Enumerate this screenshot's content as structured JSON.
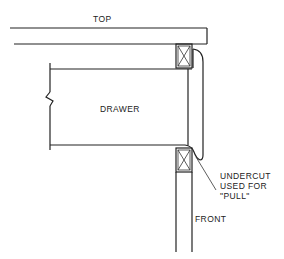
{
  "diagram": {
    "labels": {
      "top": "TOP",
      "drawer": "DRAWER",
      "undercut_line1": "UNDERCUT",
      "undercut_line2": "USED FOR",
      "undercut_line3": "\"PULL\"",
      "front": "FRONT"
    },
    "components": [
      "top-board",
      "upper-rail-block",
      "drawer-box",
      "drawer-front",
      "lower-rail-block",
      "front-frame",
      "undercut-leader"
    ]
  }
}
